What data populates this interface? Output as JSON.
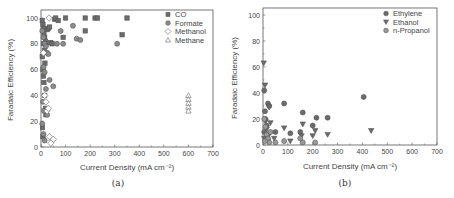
{
  "chart_data": [
    {
      "id": "a",
      "type": "scatter",
      "title": "",
      "caption": "(a)",
      "xlabel": "Current Density (mA cm⁻²)",
      "ylabel": "Faradaic Efficiency (%)",
      "xlim": [
        0,
        700
      ],
      "ylim": [
        0,
        100
      ],
      "xticks": [
        0,
        100,
        200,
        300,
        400,
        500,
        600,
        700
      ],
      "yticks": [
        0,
        20,
        40,
        60,
        80,
        100
      ],
      "grid": false,
      "legend_position": "upper right",
      "series": [
        {
          "name": "CO",
          "marker": "square",
          "color": "#6b6b6b",
          "points": [
            [
              5,
              98
            ],
            [
              8,
              95
            ],
            [
              10,
              92
            ],
            [
              12,
              88
            ],
            [
              15,
              85
            ],
            [
              18,
              82
            ],
            [
              20,
              80
            ],
            [
              25,
              91
            ],
            [
              30,
              92
            ],
            [
              35,
              93
            ],
            [
              40,
              81
            ],
            [
              45,
              80
            ],
            [
              55,
              99
            ],
            [
              60,
              100
            ],
            [
              70,
              98
            ],
            [
              90,
              85
            ],
            [
              100,
              100
            ],
            [
              180,
              100
            ],
            [
              180,
              90
            ],
            [
              220,
              100
            ],
            [
              230,
              100
            ],
            [
              330,
              87
            ],
            [
              350,
              100
            ],
            [
              5,
              70
            ],
            [
              8,
              60
            ],
            [
              10,
              55
            ],
            [
              12,
              50
            ],
            [
              15,
              40
            ],
            [
              18,
              30
            ],
            [
              20,
              25
            ],
            [
              6,
              15
            ],
            [
              8,
              8
            ],
            [
              10,
              80
            ],
            [
              14,
              75
            ],
            [
              16,
              65
            ]
          ]
        },
        {
          "name": "Formate",
          "marker": "circle",
          "color": "#8c8c8c",
          "points": [
            [
              5,
              90
            ],
            [
              10,
              85
            ],
            [
              15,
              80
            ],
            [
              20,
              78
            ],
            [
              25,
              73
            ],
            [
              30,
              72
            ],
            [
              35,
              52
            ],
            [
              50,
              47
            ],
            [
              65,
              80
            ],
            [
              80,
              90
            ],
            [
              90,
              80
            ],
            [
              130,
              94
            ],
            [
              145,
              84
            ],
            [
              160,
              83
            ],
            [
              310,
              80
            ],
            [
              10,
              62
            ],
            [
              15,
              58
            ],
            [
              20,
              45
            ],
            [
              8,
              35
            ],
            [
              12,
              28
            ],
            [
              25,
              25
            ],
            [
              5,
              18
            ],
            [
              10,
              10
            ],
            [
              15,
              5
            ]
          ]
        },
        {
          "name": "Methanol",
          "marker": "diamond",
          "color": "#ffffff",
          "points": [
            [
              33,
              100
            ],
            [
              10,
              73
            ],
            [
              15,
              40
            ],
            [
              20,
              35
            ],
            [
              25,
              28
            ],
            [
              30,
              30
            ],
            [
              35,
              8
            ],
            [
              45,
              5
            ],
            [
              50,
              6
            ],
            [
              40,
              3
            ]
          ]
        },
        {
          "name": "Methane",
          "marker": "triangle",
          "color": "#ffffff",
          "points": [
            [
              600,
              40
            ],
            [
              600,
              37
            ],
            [
              600,
              34
            ],
            [
              600,
              31
            ],
            [
              600,
              28
            ]
          ]
        }
      ]
    },
    {
      "id": "b",
      "type": "scatter",
      "title": "",
      "caption": "(b)",
      "xlabel": "Current Density (mA cm⁻²)",
      "ylabel": "Faradaic Efficiency (%)",
      "xlim": [
        0,
        700
      ],
      "ylim": [
        0,
        100
      ],
      "xticks": [
        0,
        100,
        200,
        300,
        400,
        500,
        600,
        700
      ],
      "yticks": [
        0,
        20,
        40,
        60,
        80,
        100
      ],
      "grid": false,
      "legend_position": "upper right",
      "series": [
        {
          "name": "Ethylene",
          "marker": "circle",
          "color": "#6b6b6b",
          "points": [
            [
              5,
              42
            ],
            [
              8,
              26
            ],
            [
              10,
              20
            ],
            [
              15,
              15
            ],
            [
              20,
              32
            ],
            [
              25,
              30
            ],
            [
              50,
              10
            ],
            [
              85,
              32
            ],
            [
              110,
              9
            ],
            [
              150,
              10
            ],
            [
              160,
              25
            ],
            [
              200,
              15
            ],
            [
              215,
              21
            ],
            [
              260,
              21
            ],
            [
              405,
              37
            ],
            [
              5,
              10
            ],
            [
              10,
              5
            ],
            [
              20,
              8
            ]
          ]
        },
        {
          "name": "Ethanol",
          "marker": "triangle-down",
          "color": "#6b6b6b",
          "points": [
            [
              3,
              63
            ],
            [
              8,
              46
            ],
            [
              10,
              18
            ],
            [
              15,
              12
            ],
            [
              25,
              29
            ],
            [
              30,
              17
            ],
            [
              45,
              5
            ],
            [
              85,
              13
            ],
            [
              110,
              3
            ],
            [
              155,
              7
            ],
            [
              160,
              16
            ],
            [
              200,
              7
            ],
            [
              210,
              11
            ],
            [
              260,
              8
            ],
            [
              435,
              11
            ],
            [
              5,
              5
            ],
            [
              20,
              3
            ]
          ]
        },
        {
          "name": "n-Propanol",
          "marker": "circle",
          "color": "#9a9a9a",
          "points": [
            [
              5,
              20
            ],
            [
              10,
              14
            ],
            [
              15,
              8
            ],
            [
              20,
              5
            ],
            [
              25,
              2
            ],
            [
              50,
              2
            ],
            [
              85,
              3
            ],
            [
              150,
              5
            ],
            [
              160,
              2
            ],
            [
              210,
              2
            ],
            [
              30,
              10
            ],
            [
              8,
              3
            ]
          ]
        }
      ]
    }
  ],
  "figure": {
    "panels": [
      {
        "frame": {
          "left": 41,
          "right": 213,
          "top": 10,
          "bottom": 147,
          "y100": 18
        },
        "caption_pos": [
          118,
          186
        ],
        "xlabel_pos": [
          127,
          170
        ],
        "ylabel_pos": [
          13,
          80
        ],
        "legend_pos": [
          165,
          13
        ]
      },
      {
        "frame": {
          "left": 263,
          "right": 437,
          "top": 8,
          "bottom": 145,
          "y100": 15
        },
        "caption_pos": [
          345,
          186
        ],
        "xlabel_pos": [
          350,
          169
        ],
        "ylabel_pos": [
          237,
          78
        ],
        "legend_pos": [
          383,
          12
        ]
      }
    ]
  }
}
